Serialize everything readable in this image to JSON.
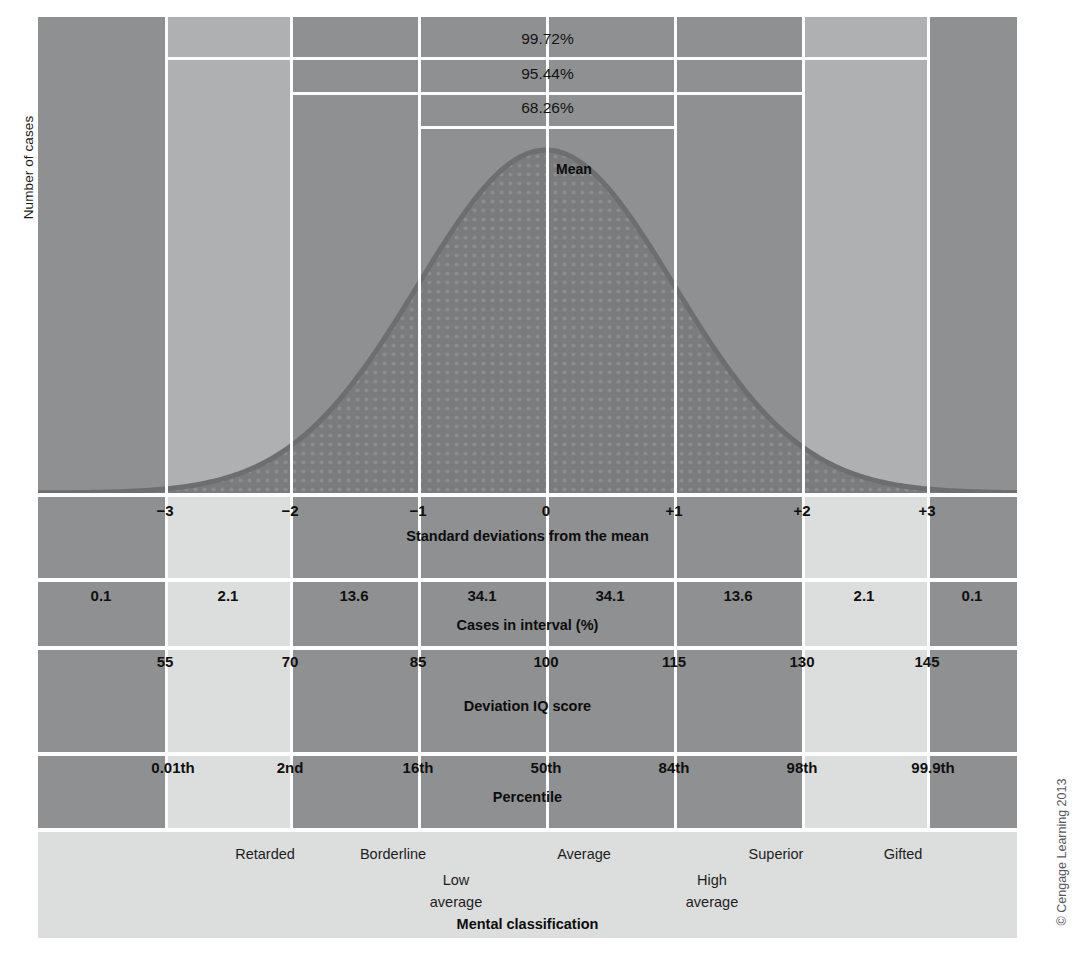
{
  "axis": {
    "y_label": "Number of cases",
    "mean_label": "Mean"
  },
  "credit": "© Cengage Learning 2013",
  "brackets": [
    {
      "label": "99.72%",
      "sd_span": 3
    },
    {
      "label": "95.44%",
      "sd_span": 2
    },
    {
      "label": "68.26%",
      "sd_span": 1
    }
  ],
  "rows": [
    {
      "name": "standard-deviations",
      "title": "Standard deviations from the mean",
      "values": [
        "−3",
        "−2",
        "−1",
        "0",
        "+1",
        "+2",
        "+3"
      ]
    },
    {
      "name": "cases-in-interval",
      "title": "Cases in interval (%)",
      "values": [
        "0.1",
        "2.1",
        "13.6",
        "34.1",
        "34.1",
        "13.6",
        "2.1",
        "0.1"
      ]
    },
    {
      "name": "deviation-iq-score",
      "title": "Deviation IQ score",
      "values": [
        "55",
        "70",
        "85",
        "100",
        "115",
        "130",
        "145"
      ]
    },
    {
      "name": "percentile",
      "title": "Percentile",
      "values": [
        "0.01th",
        "2nd",
        "16th",
        "50th",
        "84th",
        "98th",
        "99.9th"
      ]
    },
    {
      "name": "mental-classification",
      "title": "Mental classification",
      "values": [
        "Retarded",
        "Borderline",
        "Low\naverage",
        "Average",
        "High\naverage",
        "Superior",
        "Gifted"
      ]
    }
  ],
  "classifications": [
    {
      "label": "Retarded",
      "x": 227,
      "row": 0
    },
    {
      "label": "Borderline",
      "x": 355,
      "row": 0
    },
    {
      "label": "Low",
      "x": 418,
      "row": 1
    },
    {
      "label": "average",
      "x": 418,
      "row": 2
    },
    {
      "label": "Average",
      "x": 546,
      "row": 0
    },
    {
      "label": "High",
      "x": 674,
      "row": 1
    },
    {
      "label": "average",
      "x": 674,
      "row": 2
    },
    {
      "label": "Superior",
      "x": 738,
      "row": 0
    },
    {
      "label": "Gifted",
      "x": 865,
      "row": 0
    }
  ],
  "colors": {
    "band_dark": "#8f9092",
    "band_light": "#dcdddd",
    "grid_white": "#fdfdfd",
    "curve_stroke": "#6f7072",
    "curve_fill": "#7a7b7d",
    "page_background": "#ffffff"
  },
  "chart_data": {
    "type": "area",
    "xlabel": "Standard deviations from the mean",
    "ylabel": "Number of cases",
    "distribution": "normal",
    "mean": 0,
    "sd": 1,
    "xlim": [
      -4.0,
      4.0
    ],
    "ylim": [
      0,
      1
    ],
    "grid": true,
    "legend": null,
    "x": [
      -3,
      -2,
      -1,
      0,
      1,
      2,
      3
    ],
    "sd_ticks": [
      "−3",
      "−2",
      "−1",
      "0",
      "+1",
      "+2",
      "+3"
    ],
    "interval_percent_categories": [
      "−4 to −3",
      "−3 to −2",
      "−2 to −1",
      "−1 to 0",
      "0 to +1",
      "+1 to +2",
      "+2 to +3",
      "+3 to +4"
    ],
    "interval_percent_values": [
      0.1,
      2.1,
      13.6,
      34.1,
      34.1,
      13.6,
      2.1,
      0.1
    ],
    "iq_scores": [
      55,
      70,
      85,
      100,
      115,
      130,
      145
    ],
    "percentiles": [
      "0.01th",
      "2nd",
      "16th",
      "50th",
      "84th",
      "98th",
      "99.9th"
    ],
    "cumulative_bands": [
      {
        "label": "68.26%",
        "range_sd": [
          -1,
          1
        ],
        "value": 68.26
      },
      {
        "label": "95.44%",
        "range_sd": [
          -2,
          2
        ],
        "value": 95.44
      },
      {
        "label": "99.72%",
        "range_sd": [
          -3,
          3
        ],
        "value": 99.72
      }
    ],
    "classification_labels": [
      "Retarded",
      "Borderline",
      "Low average",
      "Average",
      "High average",
      "Superior",
      "Gifted"
    ],
    "annotations": [
      "Mean"
    ]
  }
}
